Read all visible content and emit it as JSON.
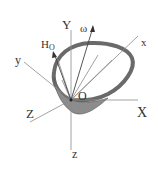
{
  "diagram": {
    "type": "rigid-body-angular-momentum",
    "colors": {
      "body_fill": "#8c8c8c",
      "body_stroke": "#555555",
      "axis": "#8a8a8a",
      "text": "#333333"
    },
    "labels": {
      "Y": "Y",
      "X": "X",
      "Z": "Z",
      "x": "x",
      "y": "y",
      "z": "z",
      "O": "O",
      "omega": "ω",
      "H": "H",
      "H_sub": "O"
    }
  }
}
